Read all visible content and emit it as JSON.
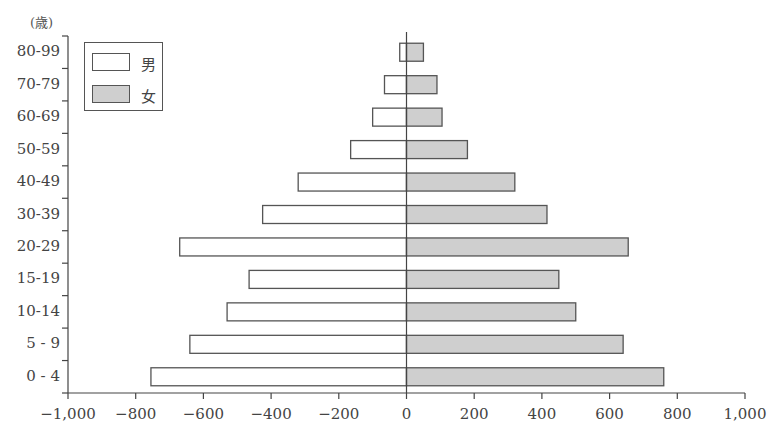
{
  "chart_data": {
    "type": "bar",
    "orientation": "horizontal",
    "subtype": "population-pyramid",
    "title": "",
    "ylabel": "(歳)",
    "xlabel": "",
    "categories": [
      "80-99",
      "70-79",
      "60-69",
      "50-59",
      "40-49",
      "30-39",
      "20-29",
      "15-19",
      "10-14",
      "5 - 9",
      "0 - 4"
    ],
    "series": [
      {
        "name": "男",
        "values": [
          -20,
          -65,
          -100,
          -165,
          -320,
          -425,
          -670,
          -465,
          -530,
          -640,
          -755
        ],
        "color": "#ffffff"
      },
      {
        "name": "女",
        "values": [
          50,
          90,
          105,
          180,
          320,
          415,
          655,
          450,
          500,
          640,
          760
        ],
        "color": "#cfcfcf"
      }
    ],
    "xlim": [
      -1000,
      1000
    ],
    "xticks": [
      -1000,
      -800,
      -600,
      -400,
      -200,
      0,
      200,
      400,
      600,
      800,
      1000
    ],
    "xtick_labels": [
      "−1,000",
      "−800",
      "−600",
      "−400",
      "−200",
      "0",
      "200",
      "400",
      "600",
      "800",
      "1,000"
    ],
    "grid": false,
    "legend_position": "upper-left"
  },
  "legend": {
    "male_label": "男",
    "female_label": "女"
  },
  "axis": {
    "unit_label": "(歳)"
  }
}
